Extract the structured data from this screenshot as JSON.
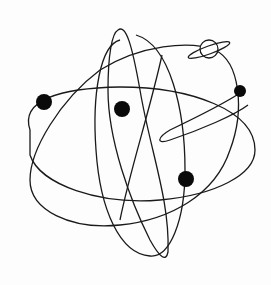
{
  "image": {
    "description": "Line drawing of an atom-like system of crossing elliptical orbits with black planet dots and a ringed planet",
    "background": "#fdfdfd",
    "stroke_color": "#1a1a1a",
    "dot_color": "#0a0a0a"
  },
  "elements": {
    "planets": [
      {
        "name": "left-planet",
        "cx": 44,
        "cy": 102,
        "r": 8
      },
      {
        "name": "center-planet",
        "cx": 122,
        "cy": 109,
        "r": 8
      },
      {
        "name": "right-small-planet",
        "cx": 240,
        "cy": 91,
        "r": 6
      },
      {
        "name": "lower-right-planet",
        "cx": 186,
        "cy": 179,
        "r": 8
      }
    ],
    "ringed_planet": {
      "cx": 209,
      "cy": 49,
      "r": 9
    }
  }
}
